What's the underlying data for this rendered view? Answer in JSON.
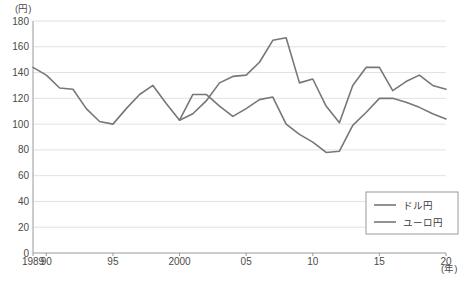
{
  "chart_data": {
    "type": "line",
    "title": "",
    "xlabel": "(年)",
    "ylabel": "(円)",
    "ylim": [
      0,
      180
    ],
    "ytick_step": 20,
    "yticks": [
      "0",
      "20",
      "40",
      "60",
      "80",
      "100",
      "120",
      "140",
      "160",
      "180"
    ],
    "xlim": [
      1989,
      2020
    ],
    "xticks": [
      {
        "year": 1989,
        "label": "1989"
      },
      {
        "year": 1990,
        "label": "90"
      },
      {
        "year": 1995,
        "label": "95"
      },
      {
        "year": 2000,
        "label": "2000"
      },
      {
        "year": 2005,
        "label": "05"
      },
      {
        "year": 2010,
        "label": "10"
      },
      {
        "year": 2015,
        "label": "15"
      },
      {
        "year": 2020,
        "label": "20"
      }
    ],
    "grid": true,
    "grid_axis": "y",
    "legend_position": "bottom-right",
    "x": [
      1989,
      1990,
      1991,
      1992,
      1993,
      1994,
      1995,
      1996,
      1997,
      1998,
      1999,
      2000,
      2001,
      2002,
      2003,
      2004,
      2005,
      2006,
      2007,
      2008,
      2009,
      2010,
      2011,
      2012,
      2013,
      2014,
      2015,
      2016,
      2017,
      2018,
      2019,
      2020
    ],
    "series": [
      {
        "name": "ドル円",
        "color": "#777777",
        "values": [
          144,
          138,
          128,
          127,
          112,
          102,
          100,
          112,
          123,
          130,
          116,
          103,
          123,
          123,
          114,
          106,
          112,
          119,
          121,
          100,
          92,
          86,
          78,
          79,
          99,
          109,
          120,
          120,
          117,
          113,
          108,
          104
        ]
      },
      {
        "name": "ユーロ円",
        "color": "#777777",
        "values": [
          null,
          null,
          null,
          null,
          null,
          null,
          null,
          null,
          null,
          null,
          null,
          103,
          108,
          118,
          132,
          137,
          138,
          148,
          165,
          167,
          132,
          135,
          114,
          101,
          130,
          144,
          144,
          126,
          133,
          138,
          130,
          127
        ]
      }
    ],
    "legend": [
      {
        "label": "ドル円"
      },
      {
        "label": "ユーロ円"
      }
    ]
  },
  "geometry": {
    "plot_left": 33,
    "plot_right": 446,
    "plot_top": 21,
    "plot_bottom": 253
  }
}
